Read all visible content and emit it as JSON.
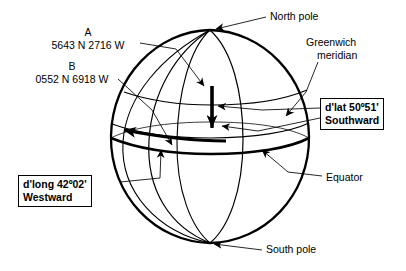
{
  "figure": {
    "ink_color": "#000000",
    "background": "#ffffff"
  },
  "positions": {
    "a": {
      "name": "A",
      "coordinates": "5643 N 2716 W"
    },
    "b": {
      "name": "B",
      "coordinates": "0552 N 6918 W"
    }
  },
  "annotations": {
    "north_pole": "North pole",
    "south_pole": "South pole",
    "greenwich_line1": "Greenwich",
    "greenwich_line2": "meridian",
    "equator": "Equator"
  },
  "callouts": {
    "dlat": {
      "line1": "d'lat 50º51'",
      "line2": "Southward"
    },
    "dlong": {
      "line1": "d'long 42º02'",
      "line2": "Westward"
    }
  }
}
